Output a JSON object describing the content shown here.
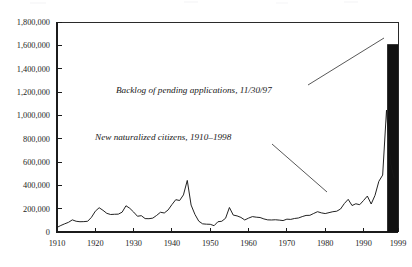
{
  "chart_data": {
    "type": "line",
    "title": "",
    "subtitle": "",
    "xlabel": "",
    "ylabel": "",
    "xlim": [
      1910,
      1999
    ],
    "ylim": [
      0,
      1800000
    ],
    "grid": false,
    "legend_position": "none",
    "y_ticks": [
      0,
      200000,
      400000,
      600000,
      800000,
      1000000,
      1200000,
      1400000,
      1600000,
      1800000
    ],
    "y_tick_labels": [
      "0",
      "200,000",
      "400,000",
      "600,000",
      "800,000",
      "1,000,000",
      "1,200,000",
      "1,400,000",
      "1,600,000",
      "1,800,000"
    ],
    "x_ticks": [
      1910,
      1920,
      1930,
      1940,
      1950,
      1960,
      1970,
      1980,
      1990,
      1999
    ],
    "x_tick_labels": [
      "1910",
      "1920",
      "1930",
      "1940",
      "1950",
      "1960",
      "1970",
      "1980",
      "1990",
      "1999"
    ],
    "series": [
      {
        "name": "New naturalized citizens, 1910–1998",
        "type": "line",
        "color": "#161616",
        "x": [
          1910,
          1911,
          1912,
          1913,
          1914,
          1915,
          1916,
          1917,
          1918,
          1919,
          1920,
          1921,
          1922,
          1923,
          1924,
          1925,
          1926,
          1927,
          1928,
          1929,
          1930,
          1931,
          1932,
          1933,
          1934,
          1935,
          1936,
          1937,
          1938,
          1939,
          1940,
          1941,
          1942,
          1943,
          1944,
          1945,
          1946,
          1947,
          1948,
          1949,
          1950,
          1951,
          1952,
          1953,
          1954,
          1955,
          1956,
          1957,
          1958,
          1959,
          1960,
          1961,
          1962,
          1963,
          1964,
          1965,
          1966,
          1967,
          1968,
          1969,
          1970,
          1971,
          1972,
          1973,
          1974,
          1975,
          1976,
          1977,
          1978,
          1979,
          1980,
          1981,
          1982,
          1983,
          1984,
          1985,
          1986,
          1987,
          1988,
          1989,
          1990,
          1991,
          1992,
          1993,
          1994,
          1995,
          1996,
          1997,
          1998
        ],
        "values": [
          39000,
          56000,
          70000,
          83000,
          104000,
          92000,
          88000,
          89000,
          92000,
          126000,
          178000,
          208000,
          186000,
          160000,
          150000,
          152000,
          153000,
          170000,
          225000,
          203000,
          171000,
          135000,
          140000,
          115000,
          114000,
          119000,
          142000,
          169000,
          163000,
          189000,
          235000,
          277000,
          270000,
          318000,
          442000,
          231000,
          151000,
          93000,
          70000,
          67000,
          66000,
          54000,
          88000,
          92000,
          118000,
          210000,
          145000,
          138000,
          125000,
          103000,
          119000,
          132000,
          127000,
          124000,
          112000,
          104000,
          103000,
          105000,
          102000,
          98000,
          110000,
          108000,
          116000,
          120000,
          132000,
          142000,
          143000,
          159000,
          174000,
          164000,
          158000,
          166000,
          174000,
          178000,
          197000,
          244000,
          280000,
          227000,
          242000,
          234000,
          270000,
          308000,
          240000,
          314000,
          434000,
          488000,
          1045000,
          598000,
          463000
        ]
      }
    ],
    "bars": [
      {
        "name": "Backlog of pending applications, 11/30/97",
        "x": 1997.6,
        "value": 1610000,
        "color": "#111111"
      }
    ],
    "annotations": [
      {
        "id": "backlog-annotation",
        "text": "Backlog of pending applications, 11/30/97",
        "style": "italic",
        "text_x": 116,
        "text_y": 93,
        "leader": [
          [
            308,
            85
          ],
          [
            384,
            38
          ]
        ]
      },
      {
        "id": "naturalized-annotation",
        "text": "New naturalized citizens, 1910–1998",
        "style": "italic",
        "text_x": 95,
        "text_y": 140,
        "leader": [
          [
            272,
            144
          ],
          [
            327,
            192
          ]
        ]
      }
    ]
  }
}
